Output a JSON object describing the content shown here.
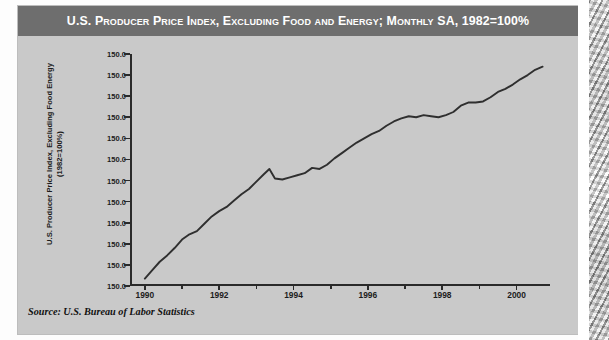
{
  "figure": {
    "title": "U.S. Producer Price Index, Excluding Food and Energy; Monthly SA, 1982=100%",
    "source": "Source: U.S. Bureau of Labor Statistics",
    "colors": {
      "title_bar": "#6e6e6e",
      "title_text": "#ffffff",
      "panel": "#c9c9c9",
      "axis": "#2a2a2a",
      "line": "#2f2f2f"
    }
  },
  "chart_data": {
    "type": "line",
    "title": "U.S. Producer Price Index, Excluding Food and Energy; Monthly SA, 1982=100%",
    "xlabel": "",
    "ylabel": "U.S. Producer Price Index, Excluding Food Energy (1982=100%)",
    "ylabel_lines": [
      "U.S. Producer Price Index, Excluding Food Energy",
      "(1982=100%)"
    ],
    "grid": false,
    "legend": false,
    "xlim": [
      1989.6,
      2000.9
    ],
    "xticks": [
      1990,
      1992,
      1994,
      1996,
      1998,
      2000
    ],
    "xtick_labels": [
      "1990",
      "1992",
      "1994",
      "1996",
      "1998",
      "2000"
    ],
    "xminor_ticks": [
      1991,
      1993,
      1995,
      1997,
      1999
    ],
    "ylim": [
      0,
      11
    ],
    "yticks": [
      0,
      1,
      2,
      3,
      4,
      5,
      6,
      7,
      8,
      9,
      10,
      11
    ],
    "ytick_labels": [
      "150.0",
      "150.0",
      "150.0",
      "150.0",
      "150.0",
      "150.0",
      "150.0",
      "150.0",
      "150.0",
      "150.0",
      "150.0",
      "150.0"
    ],
    "series": [
      {
        "name": "PPI excluding food and energy",
        "x": [
          1990.0,
          1990.2,
          1990.4,
          1990.6,
          1990.8,
          1991.0,
          1991.2,
          1991.4,
          1991.6,
          1991.8,
          1992.0,
          1992.2,
          1992.4,
          1992.6,
          1992.8,
          1993.0,
          1993.2,
          1993.35,
          1993.5,
          1993.7,
          1993.9,
          1994.1,
          1994.3,
          1994.5,
          1994.7,
          1994.9,
          1995.1,
          1995.3,
          1995.5,
          1995.7,
          1995.9,
          1996.1,
          1996.3,
          1996.5,
          1996.7,
          1996.9,
          1997.1,
          1997.3,
          1997.5,
          1997.7,
          1997.9,
          1998.1,
          1998.3,
          1998.5,
          1998.7,
          1998.9,
          1999.1,
          1999.3,
          1999.5,
          1999.7,
          1999.9,
          2000.1,
          2000.3,
          2000.5,
          2000.7
        ],
        "y": [
          0.35,
          0.75,
          1.15,
          1.45,
          1.8,
          2.2,
          2.45,
          2.6,
          2.95,
          3.3,
          3.55,
          3.75,
          4.05,
          4.35,
          4.6,
          4.95,
          5.3,
          5.55,
          5.1,
          5.05,
          5.15,
          5.25,
          5.35,
          5.6,
          5.55,
          5.75,
          6.05,
          6.3,
          6.55,
          6.8,
          7.0,
          7.2,
          7.35,
          7.6,
          7.8,
          7.95,
          8.05,
          8.0,
          8.1,
          8.05,
          8.0,
          8.1,
          8.25,
          8.55,
          8.7,
          8.7,
          8.75,
          8.95,
          9.2,
          9.35,
          9.55,
          9.8,
          10.0,
          10.25,
          10.4
        ]
      }
    ]
  }
}
